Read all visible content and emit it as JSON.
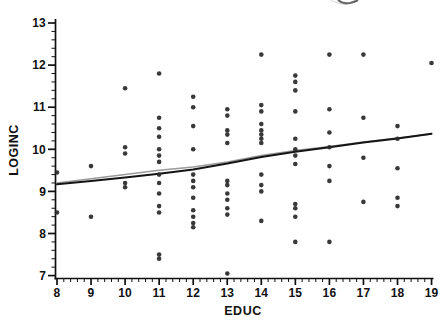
{
  "figure": {
    "background": "#ffffff",
    "top_edge_artifact": "clipped-text-fragment"
  },
  "chart_data": {
    "type": "scatter",
    "title": "",
    "xlabel": "EDUC",
    "ylabel": "LOGINC",
    "xlim": [
      8,
      19
    ],
    "ylim": [
      7,
      13
    ],
    "x_major_ticks": [
      8,
      9,
      10,
      11,
      12,
      13,
      14,
      15,
      16,
      17,
      18,
      19
    ],
    "y_major_ticks": [
      7,
      8,
      9,
      10,
      11,
      12,
      13
    ],
    "minor_tick_step": 0.2,
    "grid": false,
    "legend": null,
    "point_color": "#2a2a2a",
    "point_radius_px": 2.3,
    "columns": [
      {
        "x": 8,
        "ys": [
          9.45,
          8.5
        ]
      },
      {
        "x": 9,
        "ys": [
          9.6,
          8.4
        ]
      },
      {
        "x": 10,
        "ys": [
          11.45,
          10.05,
          9.9,
          9.2,
          9.1
        ]
      },
      {
        "x": 11,
        "ys": [
          11.8,
          10.75,
          10.5,
          10.3,
          10.0,
          9.85,
          9.7,
          9.4,
          9.2,
          8.95,
          8.65,
          8.5,
          7.5,
          7.4
        ]
      },
      {
        "x": 12,
        "ys": [
          11.25,
          11.0,
          10.55,
          10.0,
          9.4,
          9.25,
          9.1,
          8.85,
          8.55,
          8.4,
          8.25,
          8.15
        ]
      },
      {
        "x": 13,
        "ys": [
          10.95,
          10.8,
          10.45,
          10.35,
          10.15,
          9.25,
          9.15,
          8.95,
          8.8,
          8.6,
          8.45,
          7.05
        ]
      },
      {
        "x": 14,
        "ys": [
          12.25,
          11.05,
          10.9,
          10.6,
          10.45,
          10.35,
          10.25,
          10.15,
          9.4,
          9.15,
          9.0,
          8.3
        ]
      },
      {
        "x": 15,
        "ys": [
          11.75,
          11.6,
          11.4,
          10.9,
          10.25,
          10.0,
          9.85,
          9.65,
          8.7,
          8.6,
          8.4,
          7.8
        ]
      },
      {
        "x": 16,
        "ys": [
          12.25,
          10.95,
          10.4,
          10.05,
          9.6,
          9.25,
          7.8
        ]
      },
      {
        "x": 17,
        "ys": [
          12.25,
          10.75,
          9.8,
          8.75
        ]
      },
      {
        "x": 18,
        "ys": [
          10.55,
          10.25,
          9.55,
          8.85,
          8.65
        ]
      },
      {
        "x": 19,
        "ys": [
          12.05
        ]
      }
    ],
    "lines": [
      {
        "name": "linear-fit-line",
        "color": "#9a9a9a",
        "width": 1.5,
        "points": [
          [
            8,
            9.2
          ],
          [
            9,
            9.3
          ],
          [
            10,
            9.4
          ],
          [
            11,
            9.5
          ],
          [
            12,
            9.58
          ],
          [
            13,
            9.7
          ],
          [
            14,
            9.85
          ],
          [
            15,
            9.97
          ],
          [
            16,
            10.07
          ],
          [
            17,
            10.17
          ],
          [
            18,
            10.27
          ],
          [
            19,
            10.36
          ]
        ]
      },
      {
        "name": "lowess-smoother-line",
        "color": "#141414",
        "width": 2,
        "points": [
          [
            8,
            9.17
          ],
          [
            9,
            9.25
          ],
          [
            10,
            9.33
          ],
          [
            11,
            9.42
          ],
          [
            12,
            9.52
          ],
          [
            13,
            9.66
          ],
          [
            14,
            9.82
          ],
          [
            15,
            9.94
          ],
          [
            16,
            10.05
          ],
          [
            17,
            10.16
          ],
          [
            18,
            10.26
          ],
          [
            19,
            10.37
          ]
        ]
      }
    ]
  }
}
